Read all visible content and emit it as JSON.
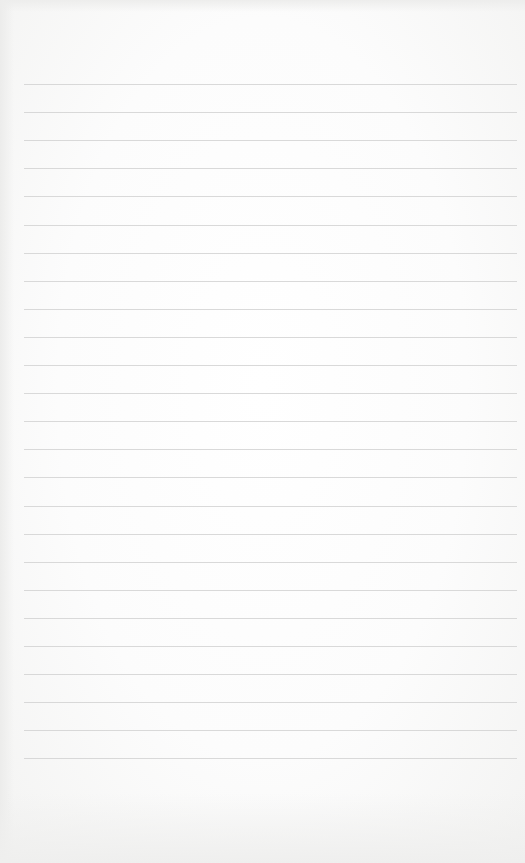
{
  "page": {
    "type": "blank-lined-paper",
    "background_color": "#fbfbfa",
    "line_color": "#d2d2d2",
    "ruled_lines": {
      "count": 25,
      "first_line_y": 84,
      "spacing_px": 28.1,
      "left_x": 24,
      "right_x": 517
    },
    "text": []
  }
}
